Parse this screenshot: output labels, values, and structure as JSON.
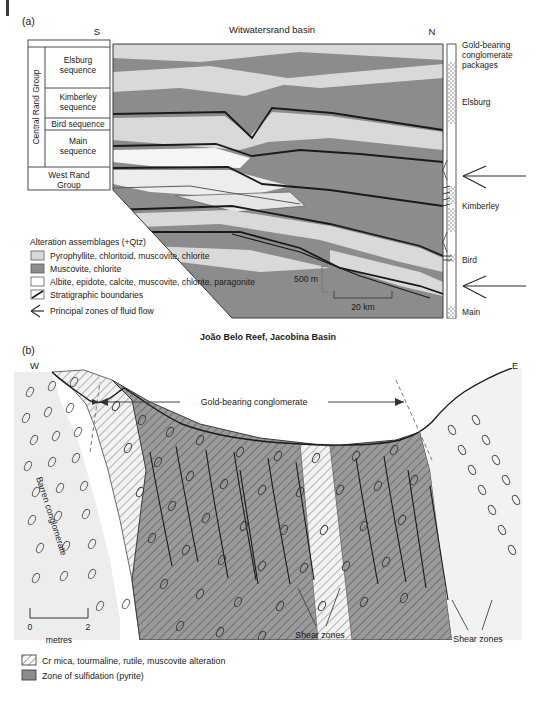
{
  "figure": {
    "panel_a": {
      "label": "(a)",
      "title": "Witwatersrand basin",
      "direction_left": "S",
      "direction_right": "N",
      "stratigraphic_column": {
        "groups": [
          {
            "name": "Central Rand Group",
            "units": [
              "Elsburg sequence",
              "Kimberley sequence",
              "Bird sequence",
              "Main sequence"
            ]
          },
          {
            "name": "West Rand Group",
            "units": []
          }
        ]
      },
      "borehole_column": {
        "header": "Gold-bearing conglomerate packages",
        "markers": [
          "Elsburg",
          "Kimberley",
          "Bird",
          "Main"
        ]
      },
      "legend": {
        "title": "Alteration assemblages (+Qtz)",
        "items": [
          {
            "swatch": "light-gray",
            "label": "Pyrophyllite, chloritoid, muscovite, chlorite"
          },
          {
            "swatch": "dark-gray",
            "label": "Muscovite, chlorite"
          },
          {
            "swatch": "white",
            "label": "Albite, epidote, calcite, muscovite, chlorite, paragonite"
          },
          {
            "swatch": "line",
            "label": "Stratigraphic boundaries"
          },
          {
            "swatch": "arrow",
            "label": "Principal zones of fluid flow"
          }
        ]
      },
      "scale_vertical": "500 m",
      "scale_horizontal": "20 km"
    },
    "panel_b": {
      "label": "(b)",
      "title": "João Belo Reef, Jacobina Basin",
      "direction_left": "W",
      "direction_right": "E",
      "annotations": {
        "span_label": "Gold-bearing conglomerate",
        "barren_label": "Barren conglomerate",
        "shear_left": "Shear zones",
        "shear_right": "Shear zones"
      },
      "scale": {
        "min": "0",
        "max": "2",
        "unit": "metres"
      },
      "legend": {
        "items": [
          {
            "swatch": "hatch",
            "label": "Cr mica, tourmaline, rutile, muscovite alteration"
          },
          {
            "swatch": "dark-gray",
            "label": "Zone of sulfidation (pyrite)"
          }
        ]
      }
    }
  },
  "colors": {
    "light_gray": "#d9d9d9",
    "dark_gray": "#8c8c8c",
    "white": "#ffffff",
    "mid_gray": "#bfbfbf",
    "pale": "#ededed",
    "stroke": "#1a1a1a",
    "thin": "#555555"
  }
}
